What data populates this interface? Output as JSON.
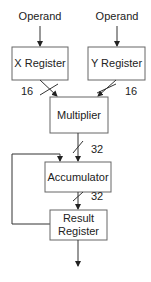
{
  "diagram": {
    "inputs": [
      {
        "label": "Operand"
      },
      {
        "label": "Operand"
      }
    ],
    "blocks": {
      "x_register": "X Register",
      "y_register": "Y Register",
      "multiplier": "Multiplier",
      "accumulator": "Accumulator",
      "result_register_line1": "Result",
      "result_register_line2": "Register"
    },
    "bus_widths": {
      "x_to_mult": "16",
      "y_to_mult": "16",
      "mult_to_acc": "32",
      "acc_to_result": "32"
    },
    "colors": {
      "stroke": "#333333",
      "box_fill": "#ffffff",
      "text": "#222222"
    }
  }
}
